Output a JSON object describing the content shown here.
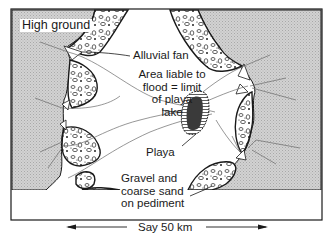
{
  "diagram": {
    "labels": {
      "high_ground": "High ground",
      "alluvial_fan": "Alluvial fan",
      "flood_area_line1": "Area liable to",
      "flood_area_line2": "flood = limit",
      "flood_area_line3": "of playa",
      "flood_area_line4": "lake",
      "playa": "Playa",
      "gravel_line1": "Gravel and",
      "gravel_line2": "coarse sand",
      "gravel_line3": "on pediment"
    },
    "scale": {
      "label": "Say 50 km"
    },
    "colors": {
      "high_ground": "#c8c8c8",
      "fan_fill": "#ffffff",
      "outline": "#1a1a1a",
      "playa_fill": "#3a3a3a",
      "stream": "#555555"
    }
  }
}
